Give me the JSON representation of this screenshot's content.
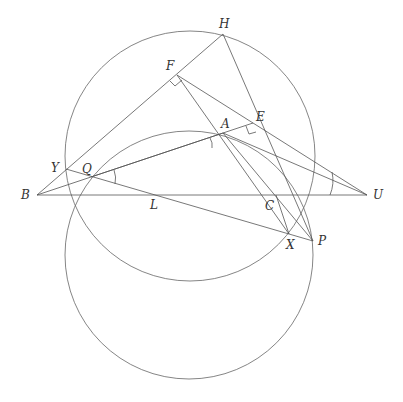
{
  "diagram": {
    "type": "geometry",
    "points": {
      "B": {
        "label": "B",
        "x": 37,
        "y": 195
      },
      "U": {
        "label": "U",
        "x": 367,
        "y": 195
      },
      "H": {
        "label": "H",
        "x": 223,
        "y": 34
      },
      "F": {
        "label": "F",
        "x": 177,
        "y": 75
      },
      "E": {
        "label": "E",
        "x": 253,
        "y": 123
      },
      "A": {
        "label": "A",
        "x": 223,
        "y": 133
      },
      "Y": {
        "label": "Y",
        "x": 66,
        "y": 169
      },
      "Q": {
        "label": "Q",
        "x": 91,
        "y": 177
      },
      "L": {
        "label": "L",
        "x": 155,
        "y": 195
      },
      "C": {
        "label": "C",
        "x": 276,
        "y": 195
      },
      "X": {
        "label": "X",
        "x": 289,
        "y": 234
      },
      "P": {
        "label": "P",
        "x": 313,
        "y": 241
      }
    },
    "labels": [
      "H",
      "F",
      "E",
      "A",
      "Y",
      "Q",
      "B",
      "L",
      "C",
      "U",
      "X",
      "P"
    ],
    "circles": [
      {
        "name": "upper-circle",
        "cx": 190,
        "cy": 156,
        "r": 125
      },
      {
        "name": "lower-circle",
        "cx": 189,
        "cy": 255,
        "r": 124
      }
    ],
    "arc": {
      "name": "arc-through-A",
      "description": "arc from Q region through A toward U region"
    },
    "right_angle_marks": [
      "F",
      "E"
    ],
    "angle_marks": [
      "Q",
      "A",
      "U"
    ]
  }
}
